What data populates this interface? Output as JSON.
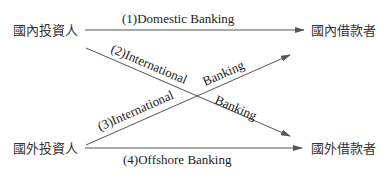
{
  "nodes": {
    "domestic_investor": "國內投資人",
    "foreign_investor": "國外投資人",
    "domestic_borrower": "國內借款者",
    "foreign_borrower": "國外借款者"
  },
  "flows": [
    {
      "id": 1,
      "label": "(1)Domestic Banking",
      "from": "domestic_investor",
      "to": "domestic_borrower"
    },
    {
      "id": 2,
      "label_part1": "(2)International",
      "label_part2": "Banking",
      "from": "domestic_investor",
      "to": "foreign_borrower"
    },
    {
      "id": 3,
      "label_part1": "(3)International",
      "label_part2": "Banking",
      "from": "foreign_investor",
      "to": "domestic_borrower"
    },
    {
      "id": 4,
      "label": "(4)Offshore Banking",
      "from": "foreign_investor",
      "to": "foreign_borrower"
    }
  ],
  "colors": {
    "line": "#555555",
    "text": "#333333"
  }
}
